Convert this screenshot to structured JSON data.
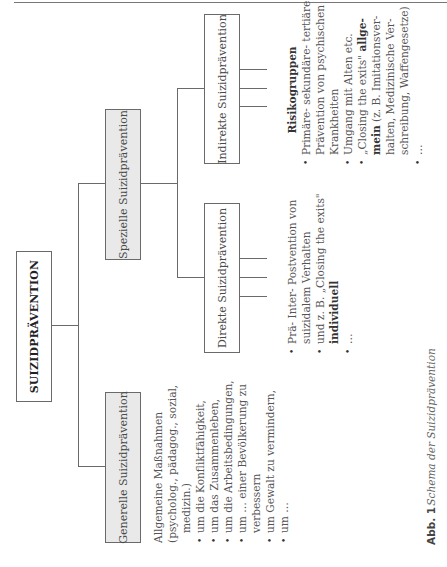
{
  "figure": {
    "root": "SUIZIDPRÄVENTION",
    "general": {
      "title": "Generelle Suizidprävention",
      "intro_lines": [
        "Allgemeine Maßnahmen",
        "(psycholog., pädagog., sozial,",
        "medizin.)"
      ],
      "bullets": [
        [
          "um die Konfliktfähigkeit,"
        ],
        [
          "um das Zusammenleben,"
        ],
        [
          "um die Arbeitsbedingungen,"
        ],
        [
          "um … einer Bevölkerung zu",
          "verbessern"
        ],
        [
          "um Gewalt zu vermindern,"
        ],
        [
          "um …"
        ]
      ]
    },
    "special": {
      "title": "Spezielle Suizidprävention",
      "direct": {
        "title": "Direkte Suizidprävention",
        "bullets": [
          [
            "Prä- Inter- Postvention von",
            "suizidalem Verhalten"
          ],
          [
            "und z. B. „Closing the exits\""
          ],
          [
            "…"
          ]
        ],
        "bold_word": "individuell"
      },
      "indirect": {
        "title": "Indirekte Suizidprävention",
        "heading": "Risikogruppen",
        "bullets": [
          [
            "Primäre- sekundäre- tertiäre",
            "Prävention von psychischen",
            "Krankheiten"
          ],
          [
            "Umgang mit Alten etc."
          ],
          [
            "„Closing the exits\"",
            "(z. B. Imitationsver-",
            "halten, Medizinische Ver-",
            "schreibung, Waffengesetze)"
          ],
          [
            "…"
          ]
        ],
        "bold_a": "allge-",
        "bold_b": "mein"
      }
    },
    "caption": {
      "label": "Abb. 1",
      "text": "Schema der Suizidprävention"
    }
  },
  "colors": {
    "box_border": "#6a6a6a",
    "grey_fill": "#e9e9e9",
    "text": "#4a4a4a"
  }
}
